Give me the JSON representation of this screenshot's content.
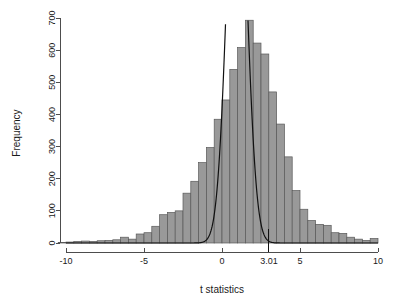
{
  "chart_data": {
    "type": "bar",
    "title": "",
    "subtitle": "",
    "xlabel": "t statistics",
    "ylabel": "Frequency",
    "xlim": [
      -10.5,
      10.5
    ],
    "ylim": [
      0,
      700
    ],
    "grid": false,
    "legend": null,
    "x_ticks": [
      {
        "value": -10,
        "label": "-10"
      },
      {
        "value": -5,
        "label": "-5"
      },
      {
        "value": 0,
        "label": "0"
      },
      {
        "value": 3.01,
        "label": "3.01"
      },
      {
        "value": 5,
        "label": "5"
      },
      {
        "value": 10,
        "label": "10"
      }
    ],
    "y_ticks": [
      {
        "value": 0,
        "label": "0"
      },
      {
        "value": 100,
        "label": "100"
      },
      {
        "value": 200,
        "label": "200"
      },
      {
        "value": 300,
        "label": "300"
      },
      {
        "value": 400,
        "label": "400"
      },
      {
        "value": 500,
        "label": "500"
      },
      {
        "value": 600,
        "label": "600"
      },
      {
        "value": 700,
        "label": "700"
      }
    ],
    "bar_color": "#999999",
    "bar_edge_color": "#595959",
    "curve_color": "#111111",
    "bin_width": 0.5,
    "bins": [
      {
        "x0": -10.5,
        "x1": -10.0,
        "count": 2
      },
      {
        "x0": -10.0,
        "x1": -9.5,
        "count": 3
      },
      {
        "x0": -9.5,
        "x1": -9.0,
        "count": 5
      },
      {
        "x0": -9.0,
        "x1": -8.5,
        "count": 6
      },
      {
        "x0": -8.5,
        "x1": -8.0,
        "count": 5
      },
      {
        "x0": -8.0,
        "x1": -7.5,
        "count": 7
      },
      {
        "x0": -7.5,
        "x1": -7.0,
        "count": 8
      },
      {
        "x0": -7.0,
        "x1": -6.5,
        "count": 10
      },
      {
        "x0": -6.5,
        "x1": -6.0,
        "count": 18
      },
      {
        "x0": -6.0,
        "x1": -5.5,
        "count": 12
      },
      {
        "x0": -5.5,
        "x1": -5.0,
        "count": 28
      },
      {
        "x0": -5.0,
        "x1": -4.5,
        "count": 32
      },
      {
        "x0": -4.5,
        "x1": -4.0,
        "count": 52
      },
      {
        "x0": -4.0,
        "x1": -3.5,
        "count": 88
      },
      {
        "x0": -3.5,
        "x1": -3.0,
        "count": 95
      },
      {
        "x0": -3.0,
        "x1": -2.5,
        "count": 100
      },
      {
        "x0": -2.5,
        "x1": -2.0,
        "count": 155
      },
      {
        "x0": -2.0,
        "x1": -1.5,
        "count": 192
      },
      {
        "x0": -1.5,
        "x1": -1.0,
        "count": 250
      },
      {
        "x0": -1.0,
        "x1": -0.5,
        "count": 297
      },
      {
        "x0": -0.5,
        "x1": 0.0,
        "count": 385
      },
      {
        "x0": 0.0,
        "x1": 0.5,
        "count": 445
      },
      {
        "x0": 0.5,
        "x1": 1.0,
        "count": 540
      },
      {
        "x0": 1.0,
        "x1": 1.5,
        "count": 608
      },
      {
        "x0": 1.5,
        "x1": 2.0,
        "count": 693
      },
      {
        "x0": 2.0,
        "x1": 2.5,
        "count": 622
      },
      {
        "x0": 2.5,
        "x1": 3.0,
        "count": 588
      },
      {
        "x0": 3.0,
        "x1": 3.5,
        "count": 470
      },
      {
        "x0": 3.5,
        "x1": 4.0,
        "count": 370
      },
      {
        "x0": 4.0,
        "x1": 4.5,
        "count": 268
      },
      {
        "x0": 4.5,
        "x1": 5.0,
        "count": 163
      },
      {
        "x0": 5.0,
        "x1": 5.5,
        "count": 105
      },
      {
        "x0": 5.5,
        "x1": 6.0,
        "count": 70
      },
      {
        "x0": 6.0,
        "x1": 6.5,
        "count": 58
      },
      {
        "x0": 6.5,
        "x1": 7.0,
        "count": 55
      },
      {
        "x0": 7.0,
        "x1": 7.5,
        "count": 32
      },
      {
        "x0": 7.5,
        "x1": 8.0,
        "count": 30
      },
      {
        "x0": 8.0,
        "x1": 8.5,
        "count": 18
      },
      {
        "x0": 8.5,
        "x1": 9.0,
        "count": 12
      },
      {
        "x0": 9.0,
        "x1": 9.5,
        "count": 8
      },
      {
        "x0": 9.5,
        "x1": 10.0,
        "count": 14
      }
    ],
    "overlay_curve": {
      "name": "null density",
      "mean": 0.95,
      "sd": 0.62,
      "peak_count": 1350,
      "description": "steep normal density curve clipped at plot top"
    },
    "threshold_marker": {
      "value": 3.01,
      "label": "3.01"
    }
  }
}
